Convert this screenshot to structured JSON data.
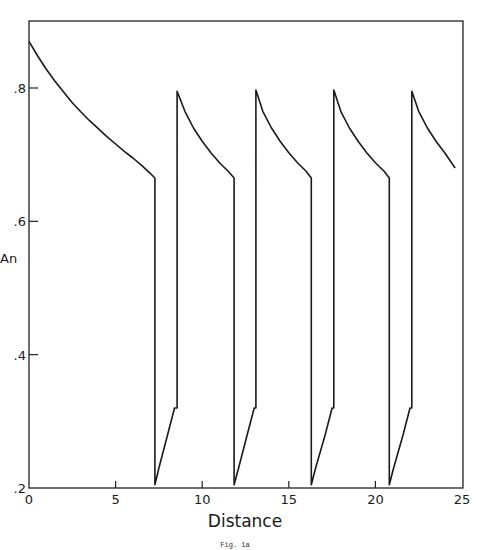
{
  "chart_data": {
    "type": "line",
    "title": "",
    "caption": "Fig. 1a",
    "xlabel": "Distance",
    "ylabel": "An",
    "xlim": [
      0,
      25
    ],
    "ylim": [
      0.2,
      0.9
    ],
    "xticks": [
      0,
      5,
      10,
      15,
      20,
      25
    ],
    "xtick_labels": [
      "0",
      "5",
      "10",
      "15",
      "20",
      "25"
    ],
    "yticks": [
      0.2,
      0.4,
      0.6,
      0.8
    ],
    "ytick_labels": [
      ".2",
      ".4",
      ".6",
      ".8"
    ],
    "grid": false,
    "legend": null,
    "series": [
      {
        "name": "An",
        "x": [
          0,
          0.5,
          1,
          1.5,
          2,
          2.5,
          3,
          3.5,
          4,
          4.5,
          5,
          5.5,
          6,
          6.5,
          7,
          7.27,
          7.27,
          7.5,
          8.0,
          8.4,
          8.5,
          8.55,
          8.55,
          9.0,
          9.5,
          10.0,
          10.5,
          11.0,
          11.5,
          11.84,
          11.84,
          12.1,
          12.6,
          13.0,
          13.1,
          13.1,
          13.5,
          14.0,
          14.5,
          15.0,
          15.5,
          16.0,
          16.3,
          16.3,
          16.55,
          17.1,
          17.5,
          17.6,
          17.6,
          18.0,
          18.5,
          19.0,
          19.5,
          20.0,
          20.5,
          20.8,
          20.8,
          21.05,
          21.6,
          22.0,
          22.1,
          22.1,
          22.5,
          23.0,
          23.5,
          24.0,
          24.6
        ],
        "y": [
          0.87,
          0.848,
          0.828,
          0.81,
          0.794,
          0.778,
          0.764,
          0.751,
          0.739,
          0.727,
          0.716,
          0.705,
          0.695,
          0.684,
          0.672,
          0.665,
          0.205,
          0.23,
          0.28,
          0.32,
          0.32,
          0.32,
          0.795,
          0.765,
          0.74,
          0.72,
          0.703,
          0.688,
          0.675,
          0.665,
          0.205,
          0.23,
          0.28,
          0.32,
          0.32,
          0.797,
          0.765,
          0.74,
          0.72,
          0.703,
          0.688,
          0.675,
          0.665,
          0.205,
          0.23,
          0.28,
          0.32,
          0.32,
          0.797,
          0.765,
          0.74,
          0.72,
          0.703,
          0.688,
          0.675,
          0.665,
          0.205,
          0.23,
          0.28,
          0.32,
          0.32,
          0.795,
          0.765,
          0.74,
          0.72,
          0.703,
          0.68
        ]
      }
    ]
  }
}
